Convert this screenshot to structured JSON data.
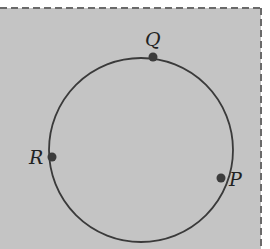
{
  "diagram": {
    "background_color": "#c4c4c4",
    "border_color": "#6a6a6a",
    "circle": {
      "cx": 141,
      "cy": 150,
      "r": 92,
      "stroke_color": "#3a3a3a"
    },
    "points": [
      {
        "id": "Q",
        "label": "Q",
        "x": 153,
        "y": 57,
        "label_x": 146,
        "label_y": 46
      },
      {
        "id": "R",
        "label": "R",
        "x": 52,
        "y": 157,
        "label_x": 29,
        "label_y": 164
      },
      {
        "id": "P",
        "label": "P",
        "x": 221,
        "y": 178,
        "label_x": 229,
        "label_y": 186
      }
    ],
    "point_color": "#3c3c3c"
  }
}
